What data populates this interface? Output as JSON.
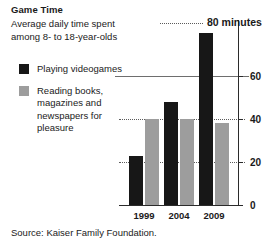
{
  "title": "Game Time",
  "subtitle_lines": [
    "Average daily time spent",
    "among 8- to 18-year-olds"
  ],
  "callout": {
    "label": "80 minutes"
  },
  "legend": {
    "items": [
      {
        "key": "videogames",
        "color": "#171717",
        "lines": [
          "Playing videogames"
        ]
      },
      {
        "key": "reading",
        "color": "#9d9d9d",
        "lines": [
          "Reading books,",
          "magazines and",
          "newspapers for",
          "pleasure"
        ]
      }
    ]
  },
  "source": "Source: Kaiser Family Foundation.",
  "chart_data": {
    "type": "bar",
    "title": "Game Time",
    "subtitle": "Average daily time spent among 8- to 18-year-olds",
    "xlabel": "",
    "ylabel": "",
    "categories": [
      "1999",
      "2004",
      "2009"
    ],
    "series": [
      {
        "name": "Playing videogames",
        "color": "#171717",
        "values": [
          23,
          48,
          80
        ]
      },
      {
        "name": "Reading books, magazines and newspapers for pleasure",
        "color": "#9d9d9d",
        "values": [
          40,
          40,
          38
        ]
      }
    ],
    "ylim": [
      0,
      80
    ],
    "yticks": [
      0,
      20,
      40,
      60
    ],
    "ytick_labels": [
      "0",
      "20",
      "40",
      "60"
    ],
    "grid": true,
    "gridlines": [
      20,
      40,
      60
    ],
    "legend_position": "upper-left-outside",
    "annotations": [
      {
        "text": "80 minutes",
        "value": 80,
        "category": "2009"
      }
    ],
    "source": "Source: Kaiser Family Foundation."
  }
}
